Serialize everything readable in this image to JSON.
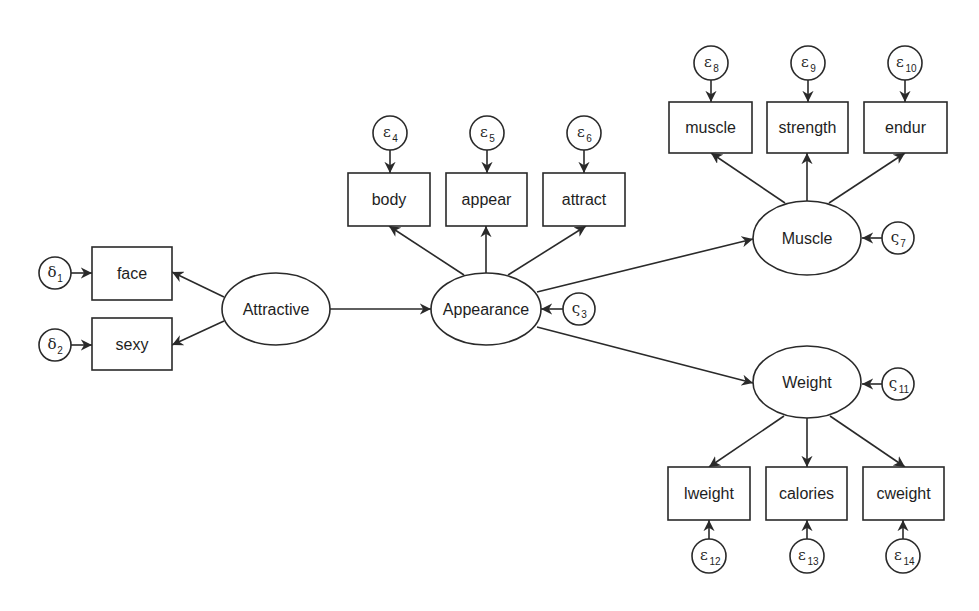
{
  "diagram": {
    "type": "structural-equation-model",
    "stroke_color": "#2a2a2a",
    "background": "#ffffff",
    "latent_variables": [
      {
        "id": "attractive",
        "label": "Attractive",
        "cx": 276,
        "cy": 309,
        "rx": 54,
        "ry": 36
      },
      {
        "id": "appearance",
        "label": "Appearance",
        "cx": 486,
        "cy": 309,
        "rx": 55,
        "ry": 36
      },
      {
        "id": "muscle_latent",
        "label": "Muscle",
        "cx": 807,
        "cy": 238,
        "rx": 54,
        "ry": 37
      },
      {
        "id": "weight_latent",
        "label": "Weight",
        "cx": 807,
        "cy": 382,
        "rx": 54,
        "ry": 36
      }
    ],
    "observed_variables": [
      {
        "id": "face",
        "label": "face",
        "x": 92,
        "y": 247,
        "w": 80,
        "h": 53
      },
      {
        "id": "sexy",
        "label": "sexy",
        "x": 92,
        "y": 318,
        "w": 80,
        "h": 52
      },
      {
        "id": "body",
        "label": "body",
        "x": 348,
        "y": 173,
        "w": 82,
        "h": 53
      },
      {
        "id": "appear",
        "label": "appear",
        "x": 446,
        "y": 173,
        "w": 81,
        "h": 53
      },
      {
        "id": "attract",
        "label": "attract",
        "x": 543,
        "y": 173,
        "w": 82,
        "h": 53
      },
      {
        "id": "muscle",
        "label": "muscle",
        "x": 669,
        "y": 102,
        "w": 83,
        "h": 51
      },
      {
        "id": "strength",
        "label": "strength",
        "x": 767,
        "y": 102,
        "w": 81,
        "h": 51
      },
      {
        "id": "endur",
        "label": "endur",
        "x": 864,
        "y": 102,
        "w": 83,
        "h": 51
      },
      {
        "id": "lweight",
        "label": "lweight",
        "x": 668,
        "y": 467,
        "w": 82,
        "h": 53
      },
      {
        "id": "calories",
        "label": "calories",
        "x": 766,
        "y": 467,
        "w": 81,
        "h": 53
      },
      {
        "id": "cweight",
        "label": "cweight",
        "x": 863,
        "y": 467,
        "w": 81,
        "h": 53
      }
    ],
    "error_terms": [
      {
        "id": "delta1",
        "symbol": "δ",
        "sub": "1",
        "cx": 55,
        "cy": 273,
        "r": 16
      },
      {
        "id": "delta2",
        "symbol": "δ",
        "sub": "2",
        "cx": 55,
        "cy": 345,
        "r": 16
      },
      {
        "id": "zeta3",
        "symbol": "ς",
        "sub": "3",
        "cx": 579,
        "cy": 309,
        "r": 16
      },
      {
        "id": "eps4",
        "symbol": "ε",
        "sub": "4",
        "cx": 390,
        "cy": 133,
        "r": 17
      },
      {
        "id": "eps5",
        "symbol": "ε",
        "sub": "5",
        "cx": 487,
        "cy": 133,
        "r": 17
      },
      {
        "id": "eps6",
        "symbol": "ε",
        "sub": "6",
        "cx": 584,
        "cy": 133,
        "r": 17
      },
      {
        "id": "zeta7",
        "symbol": "ς",
        "sub": "7",
        "cx": 898,
        "cy": 238,
        "r": 16
      },
      {
        "id": "eps8",
        "symbol": "ε",
        "sub": "8",
        "cx": 711,
        "cy": 63,
        "r": 17
      },
      {
        "id": "eps9",
        "symbol": "ε",
        "sub": "9",
        "cx": 808,
        "cy": 63,
        "r": 17
      },
      {
        "id": "eps10",
        "symbol": "ε",
        "sub": "10",
        "cx": 905,
        "cy": 63,
        "r": 17
      },
      {
        "id": "zeta11",
        "symbol": "ς",
        "sub": "11",
        "cx": 898,
        "cy": 384,
        "r": 16
      },
      {
        "id": "eps12",
        "symbol": "ε",
        "sub": "12",
        "cx": 709,
        "cy": 556,
        "r": 17
      },
      {
        "id": "eps13",
        "symbol": "ε",
        "sub": "13",
        "cx": 807,
        "cy": 556,
        "r": 17
      },
      {
        "id": "eps14",
        "symbol": "ε",
        "sub": "14",
        "cx": 903,
        "cy": 556,
        "r": 17
      }
    ],
    "paths": [
      {
        "from": "delta1",
        "to": "face",
        "x1": 71,
        "y1": 273,
        "x2": 92,
        "y2": 273
      },
      {
        "from": "delta2",
        "to": "sexy",
        "x1": 71,
        "y1": 345,
        "x2": 92,
        "y2": 345
      },
      {
        "from": "attractive",
        "to": "face",
        "x1": 224,
        "y1": 297,
        "x2": 172,
        "y2": 272
      },
      {
        "from": "attractive",
        "to": "sexy",
        "x1": 224,
        "y1": 321,
        "x2": 172,
        "y2": 345
      },
      {
        "from": "attractive",
        "to": "appearance",
        "x1": 330,
        "y1": 309,
        "x2": 431,
        "y2": 309
      },
      {
        "from": "zeta3",
        "to": "appearance",
        "x1": 563,
        "y1": 309,
        "x2": 541,
        "y2": 309
      },
      {
        "from": "eps4",
        "to": "body",
        "x1": 390,
        "y1": 150,
        "x2": 390,
        "y2": 173
      },
      {
        "from": "eps5",
        "to": "appear",
        "x1": 487,
        "y1": 150,
        "x2": 487,
        "y2": 173
      },
      {
        "from": "eps6",
        "to": "attract",
        "x1": 584,
        "y1": 150,
        "x2": 584,
        "y2": 173
      },
      {
        "from": "appearance",
        "to": "body",
        "x1": 464,
        "y1": 275,
        "x2": 389,
        "y2": 226
      },
      {
        "from": "appearance",
        "to": "appear",
        "x1": 486,
        "y1": 273,
        "x2": 486,
        "y2": 226
      },
      {
        "from": "appearance",
        "to": "attract",
        "x1": 508,
        "y1": 275,
        "x2": 586,
        "y2": 226
      },
      {
        "from": "appearance",
        "to": "muscle_latent",
        "x1": 537,
        "y1": 292,
        "x2": 753,
        "y2": 239
      },
      {
        "from": "appearance",
        "to": "weight_latent",
        "x1": 537,
        "y1": 327,
        "x2": 753,
        "y2": 383
      },
      {
        "from": "zeta7",
        "to": "muscle_latent",
        "x1": 882,
        "y1": 238,
        "x2": 862,
        "y2": 238
      },
      {
        "from": "eps8",
        "to": "muscle",
        "x1": 711,
        "y1": 80,
        "x2": 711,
        "y2": 102
      },
      {
        "from": "eps9",
        "to": "strength",
        "x1": 808,
        "y1": 80,
        "x2": 808,
        "y2": 102
      },
      {
        "from": "eps10",
        "to": "endur",
        "x1": 905,
        "y1": 80,
        "x2": 905,
        "y2": 102
      },
      {
        "from": "muscle_latent",
        "to": "muscle",
        "x1": 785,
        "y1": 203,
        "x2": 711,
        "y2": 153
      },
      {
        "from": "muscle_latent",
        "to": "strength",
        "x1": 807,
        "y1": 201,
        "x2": 807,
        "y2": 153
      },
      {
        "from": "muscle_latent",
        "to": "endur",
        "x1": 829,
        "y1": 203,
        "x2": 905,
        "y2": 153
      },
      {
        "from": "zeta11",
        "to": "weight_latent",
        "x1": 882,
        "y1": 384,
        "x2": 862,
        "y2": 384
      },
      {
        "from": "weight_latent",
        "to": "lweight",
        "x1": 784,
        "y1": 416,
        "x2": 709,
        "y2": 467
      },
      {
        "from": "weight_latent",
        "to": "calories",
        "x1": 807,
        "y1": 418,
        "x2": 807,
        "y2": 467
      },
      {
        "from": "weight_latent",
        "to": "cweight",
        "x1": 830,
        "y1": 416,
        "x2": 905,
        "y2": 467
      },
      {
        "from": "eps12",
        "to": "lweight",
        "x1": 709,
        "y1": 539,
        "x2": 709,
        "y2": 520
      },
      {
        "from": "eps13",
        "to": "calories",
        "x1": 807,
        "y1": 539,
        "x2": 807,
        "y2": 520
      },
      {
        "from": "eps14",
        "to": "cweight",
        "x1": 903,
        "y1": 539,
        "x2": 903,
        "y2": 520
      }
    ]
  }
}
